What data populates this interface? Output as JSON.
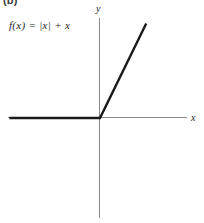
{
  "figure": {
    "part_label": "(b)",
    "equation": "f(x) = |x| + x",
    "axis_labels": {
      "x": "x",
      "y": "y"
    }
  },
  "chart_data": {
    "type": "line",
    "title": "",
    "subtitle": "",
    "xlabel": "x",
    "ylabel": "y",
    "function": "f(x) = |x| + x",
    "grid": false,
    "legend": null,
    "axes": {
      "x_origin_px": 100,
      "y_origin_px": 118,
      "xlim": [
        -5.0,
        4.8
      ],
      "ylim": [
        -5.4,
        5.4
      ],
      "x_axis_from_px": 8,
      "x_axis_to_px": 187,
      "y_axis_from_px": 18,
      "y_axis_to_px": 218
    },
    "series": [
      {
        "name": "f(x) = |x| + x",
        "color": "#1a1a1a",
        "width_px": 2.4,
        "segments": [
          {
            "name": "negative-branch",
            "description": "f(x) = 0 for x <= 0 (ray lies along the negative x-axis)",
            "points": [
              [
                -5.0,
                0
              ],
              [
                0,
                0
              ]
            ]
          },
          {
            "name": "positive-branch",
            "description": "f(x) = 2x for x > 0 (slope 2 ray from the origin)",
            "points": [
              [
                0,
                0
              ],
              [
                2.55,
                5.1
              ]
            ]
          }
        ]
      }
    ],
    "annotations": [
      {
        "text": "f(x) = |x| + x",
        "x_px": 9,
        "y_px": 19
      },
      {
        "text": "(b)",
        "x_px": 3,
        "y_px": -5
      }
    ],
    "colors": {
      "background": "#ffffff",
      "axis": "#8a8a8a",
      "curve": "#1a1a1a",
      "text": "#1d1d1d"
    }
  }
}
